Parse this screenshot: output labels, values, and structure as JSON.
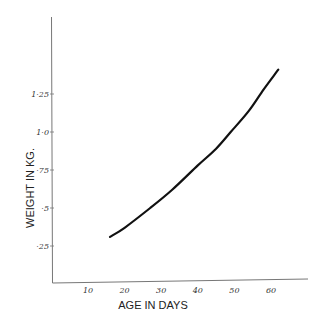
{
  "chart_data": {
    "type": "line",
    "title": "",
    "xlabel": "AGE IN DAYS",
    "ylabel": "WEIGHT IN KG.",
    "x_ticks": [
      10,
      20,
      30,
      40,
      50,
      60
    ],
    "x_tick_labels": [
      "10",
      "20",
      "30",
      "40",
      "50",
      "60"
    ],
    "y_ticks": [
      0.25,
      0.5,
      0.75,
      1.0,
      1.25
    ],
    "y_tick_labels": [
      "·25",
      "·5",
      "·75",
      "1·0",
      "1·25"
    ],
    "xlim": [
      0,
      70
    ],
    "ylim": [
      0,
      1.75
    ],
    "grid": false,
    "legend": null,
    "series": [
      {
        "name": "Weight",
        "x": [
          16,
          20,
          27,
          33,
          40,
          45,
          49,
          54,
          58,
          62
        ],
        "y": [
          0.31,
          0.37,
          0.5,
          0.62,
          0.78,
          0.89,
          1.0,
          1.14,
          1.28,
          1.41
        ]
      }
    ]
  },
  "axes": {
    "x_title": "AGE IN DAYS",
    "y_title": "WEIGHT IN KG."
  }
}
